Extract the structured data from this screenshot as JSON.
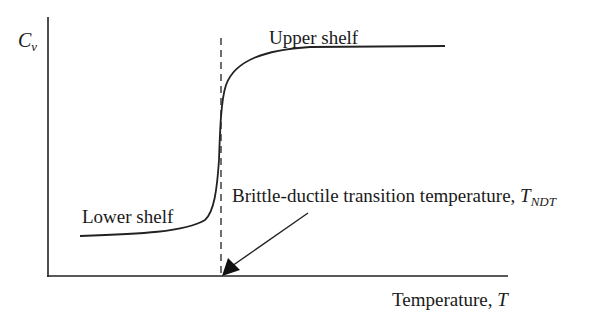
{
  "diagram": {
    "type": "ductile-brittle transition curve",
    "y_axis": {
      "symbol": "C",
      "subscript": "v"
    },
    "x_axis": {
      "label": "Temperature, ",
      "symbol": "T"
    },
    "annotations": {
      "upper_shelf": "Upper shelf",
      "lower_shelf": "Lower shelf",
      "transition": {
        "text": "Brittle-ductile transition temperature, ",
        "symbol": "T",
        "subscript": "NDT"
      }
    },
    "colors": {
      "line": "#1a1a1a",
      "background": "#ffffff"
    }
  }
}
